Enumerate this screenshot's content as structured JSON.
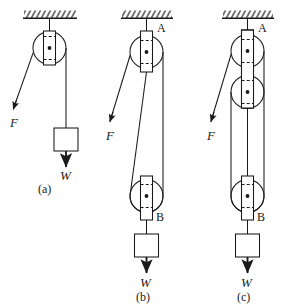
{
  "figure": {
    "title": "",
    "background_color": "#ffffff",
    "stroke_color": "#1a1a1a",
    "panels": [
      {
        "id": "a",
        "caption": "(a)",
        "pulley_count": 1,
        "movable_pulley_count": 0,
        "pulley_labels": [],
        "force_label": "F",
        "weight_label": "W",
        "mechanical_advantage": "1",
        "description": "single fixed pulley"
      },
      {
        "id": "b",
        "caption": "(b)",
        "pulley_count": 2,
        "movable_pulley_count": 1,
        "pulley_labels": [
          "A",
          "B"
        ],
        "force_label": "F",
        "weight_label": "W",
        "mechanical_advantage": "2",
        "description": "one fixed pulley A and one movable pulley B"
      },
      {
        "id": "c",
        "caption": "(c)",
        "pulley_count": 3,
        "movable_pulley_count": 1,
        "pulley_labels": [
          "A",
          "B"
        ],
        "force_label": "F",
        "weight_label": "W",
        "mechanical_advantage": "3",
        "description": "double fixed pulley block A and one movable pulley B"
      }
    ],
    "labels": {
      "force": "F",
      "weight": "W",
      "fixed_pulley": "A",
      "movable_pulley": "B"
    }
  }
}
